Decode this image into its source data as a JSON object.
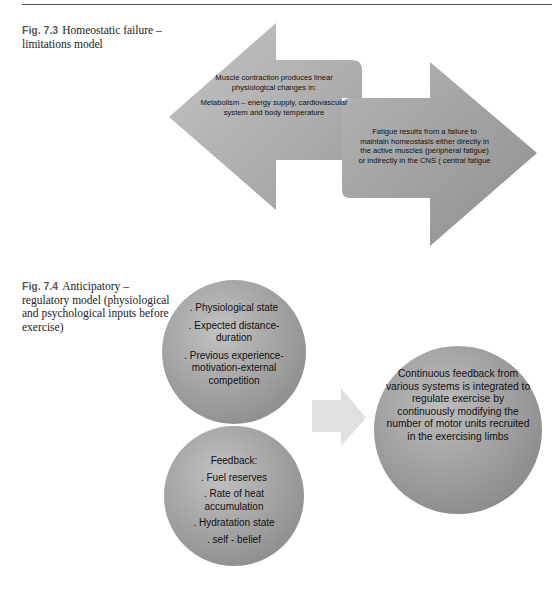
{
  "figures": [
    {
      "label": "Fig. 7.3",
      "caption": "Homeostatic failure – limitations model",
      "left_arrow_text": [
        "Muscle contraction produces linear physiological changes in:",
        "Metabolism – energy supply, cardiovascular system and body temperature"
      ],
      "right_arrow_text": "Fatigue results from a failure to maintain homeostasis either directly in the active muscles (peripheral fatigue) or indirectly in the CNS ( central fatigue"
    },
    {
      "label": "Fig. 7.4",
      "caption": "Anticipatory – regulatory model (physiological and psychological inputs before exercise)",
      "circle_inputs": [
        ". Physiological state",
        ". Expected distance-duration",
        ". Previous experience-motivation-external competition"
      ],
      "circle_feedback": [
        "Feedback:",
        ". Fuel reserves",
        ". Rate of heat accumulation",
        ". Hydratation state",
        ". self - belief"
      ],
      "circle_outcome": "Continuous feedback from various systems is integrated to regulate exercise by continuously modifying the number of motor units recruited in the exercising limbs"
    }
  ],
  "colors": {
    "shape_light": "#b8b8b8",
    "shape_dark": "#8c8c8c",
    "small_arrow": "#e2e2e2"
  }
}
